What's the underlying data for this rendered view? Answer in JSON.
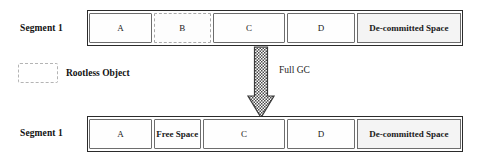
{
  "diagram": {
    "colors": {
      "bar_border": "#2b2b2b",
      "cell_border": "#6d6d6d",
      "dashed_border": "#a8a8a8",
      "hatch_fill": "#f4f4f4",
      "arrow_fill": "#7a7a7a",
      "text": "#1a1a1a"
    },
    "before": {
      "label": "Segment 1",
      "cells": [
        {
          "text": "A",
          "style": "solid",
          "width_pct": 16.8
        },
        {
          "text": "B",
          "style": "dashed",
          "width_pct": 15.2
        },
        {
          "text": "C",
          "style": "solid",
          "width_pct": 19.4
        },
        {
          "text": "D",
          "style": "solid",
          "width_pct": 18.1
        },
        {
          "text": "De-committed Space",
          "style": "hatched",
          "width_pct": 30.5
        }
      ]
    },
    "after": {
      "label": "Segment 1",
      "cells": [
        {
          "text": "A",
          "style": "solid",
          "width_pct": 16.8
        },
        {
          "text": "Free Space",
          "style": "solid-bold",
          "width_pct": 12.5
        },
        {
          "text": "C",
          "style": "solid",
          "width_pct": 22.1
        },
        {
          "text": "D",
          "style": "solid",
          "width_pct": 18.1
        },
        {
          "text": "De-committed Space",
          "style": "hatched",
          "width_pct": 30.5
        }
      ]
    },
    "legend": {
      "label": "Rootless Object"
    },
    "transition": {
      "caption": "Full GC",
      "arrow_direction": "down",
      "arrow_pattern": "checkered"
    }
  }
}
